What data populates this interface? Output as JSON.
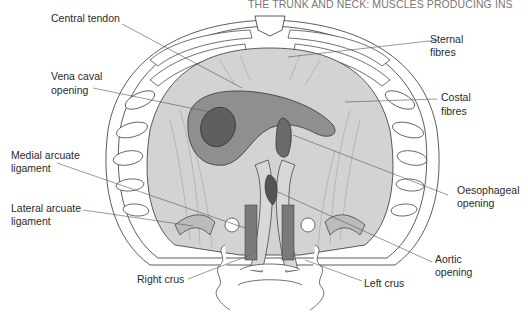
{
  "header": "THE TRUNK AND NECK: MUSCLES PRODUCING INS",
  "figure": {
    "colors": {
      "muscle": "#d3d3d3",
      "tendon": "#8f8f8f",
      "opening": "#5f5f5f",
      "rib": "#ffffff",
      "outline": "#333333",
      "leader": "#555555"
    }
  },
  "labels": {
    "central_tendon": "Central tendon",
    "vena_caval_1": "Vena caval",
    "vena_caval_2": "opening",
    "medial_arcuate_1": "Medial arcuate",
    "medial_arcuate_2": "ligament",
    "lateral_arcuate_1": "Lateral arcuate",
    "lateral_arcuate_2": "ligament",
    "right_crus": "Right crus",
    "sternal_1": "Sternal",
    "sternal_2": "fibres",
    "costal_1": "Costal",
    "costal_2": "fibres",
    "oesophageal_1": "Oesophageal",
    "oesophageal_2": "opening",
    "aortic_1": "Aortic",
    "aortic_2": "opening",
    "left_crus": "Left crus"
  }
}
